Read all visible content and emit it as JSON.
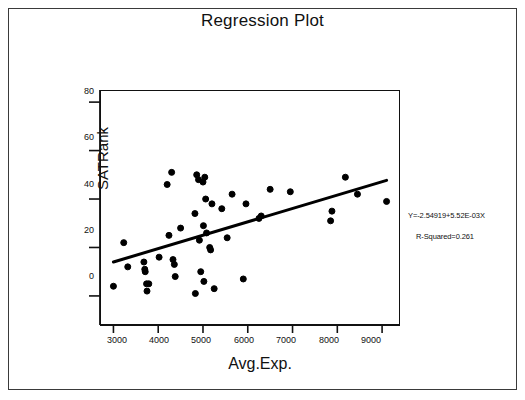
{
  "title": "Regression Plot",
  "annotations": {
    "equation": "Y=-2.54919+5.52E-03X",
    "r_squared": "R-Squared=0.261"
  },
  "axes": {
    "x_title": "Avg.Exp.",
    "y_title": "SATRank",
    "x_ticks": [
      "3000",
      "4000",
      "5000",
      "6000",
      "7000",
      "8000",
      "9000"
    ],
    "y_ticks": [
      "80",
      "60",
      "40",
      "20",
      "0"
    ]
  },
  "chart_data": {
    "type": "scatter",
    "title": "Regression Plot",
    "xlabel": "Avg.Exp.",
    "ylabel": "SATRank",
    "xlim": [
      2700,
      9400
    ],
    "ylim": [
      -12,
      85
    ],
    "xticks": [
      3000,
      4000,
      5000,
      6000,
      7000,
      8000,
      9000
    ],
    "yticks": [
      0,
      20,
      40,
      60,
      80
    ],
    "grid": false,
    "legend": null,
    "marker": {
      "shape": "circle",
      "filled": true,
      "color": "#000000",
      "size": 6
    },
    "fit_line": {
      "label": "Y=-2.54919+5.52E-03X",
      "intercept": -2.54919,
      "slope": 0.00552,
      "r_squared": 0.261,
      "color": "#000000",
      "width": 3,
      "x_start": 3000,
      "x_end": 9100
    },
    "annotations": [
      {
        "text": "Y=-2.54919+5.52E-03X",
        "x": 9900,
        "y": 26
      },
      {
        "text": "R-Squared=0.261",
        "x": 9900,
        "y": 18
      }
    ],
    "points": [
      {
        "x": 3000,
        "y": 4
      },
      {
        "x": 3230,
        "y": 22
      },
      {
        "x": 3320,
        "y": 12
      },
      {
        "x": 3680,
        "y": 14
      },
      {
        "x": 3700,
        "y": 11
      },
      {
        "x": 3710,
        "y": 10
      },
      {
        "x": 3740,
        "y": 5
      },
      {
        "x": 3750,
        "y": 2
      },
      {
        "x": 3790,
        "y": 5
      },
      {
        "x": 4020,
        "y": 16
      },
      {
        "x": 4200,
        "y": 46
      },
      {
        "x": 4240,
        "y": 25
      },
      {
        "x": 4300,
        "y": 51
      },
      {
        "x": 4330,
        "y": 15
      },
      {
        "x": 4360,
        "y": 13
      },
      {
        "x": 4380,
        "y": 8
      },
      {
        "x": 4500,
        "y": 28
      },
      {
        "x": 4820,
        "y": 34
      },
      {
        "x": 4830,
        "y": 1
      },
      {
        "x": 4860,
        "y": 50
      },
      {
        "x": 4900,
        "y": 48
      },
      {
        "x": 4920,
        "y": 23
      },
      {
        "x": 4950,
        "y": 10
      },
      {
        "x": 5000,
        "y": 47
      },
      {
        "x": 5010,
        "y": 29
      },
      {
        "x": 5020,
        "y": 6
      },
      {
        "x": 5040,
        "y": 49
      },
      {
        "x": 5060,
        "y": 40
      },
      {
        "x": 5080,
        "y": 26
      },
      {
        "x": 5150,
        "y": 20
      },
      {
        "x": 5170,
        "y": 19
      },
      {
        "x": 5200,
        "y": 38
      },
      {
        "x": 5250,
        "y": 3
      },
      {
        "x": 5420,
        "y": 36
      },
      {
        "x": 5540,
        "y": 24
      },
      {
        "x": 5650,
        "y": 42
      },
      {
        "x": 5900,
        "y": 7
      },
      {
        "x": 5960,
        "y": 38
      },
      {
        "x": 6250,
        "y": 32
      },
      {
        "x": 6300,
        "y": 33
      },
      {
        "x": 6500,
        "y": 44
      },
      {
        "x": 6950,
        "y": 43
      },
      {
        "x": 7850,
        "y": 31
      },
      {
        "x": 7880,
        "y": 35
      },
      {
        "x": 8180,
        "y": 49
      },
      {
        "x": 8450,
        "y": 42
      },
      {
        "x": 9100,
        "y": 39
      }
    ]
  }
}
